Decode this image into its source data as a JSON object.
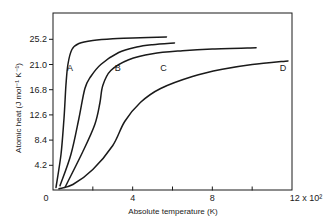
{
  "chart_data": {
    "type": "line",
    "title": "",
    "xlabel": "Absolute temperature (K)",
    "ylabel": "Atomic heat (J mol⁻¹ K⁻¹)",
    "x_multiplier_label": "12 x 10²",
    "x_unit_scale": 100,
    "xlim": [
      0,
      12
    ],
    "ylim": [
      0,
      29
    ],
    "x_ticks": [
      0,
      2,
      4,
      6,
      8,
      10,
      12
    ],
    "x_tick_labels": [
      "0",
      "",
      "4",
      "",
      "8",
      "",
      "12 x 10²"
    ],
    "y_ticks": [
      4.2,
      8.4,
      12.6,
      16.8,
      21.0,
      25.2
    ],
    "y_tick_labels": [
      "4.2",
      "8.4",
      "12.6",
      "16.8",
      "21.0",
      "25.2"
    ],
    "origin_label": "0",
    "grid": false,
    "legend": "inline labels",
    "series": [
      {
        "name": "A",
        "label_at": [
          0.85,
          20.4
        ],
        "x": [
          0.15,
          0.4,
          0.55,
          0.65,
          0.75,
          0.95,
          1.3,
          2.0,
          3.0,
          4.0,
          5.7
        ],
        "y": [
          0.5,
          6.0,
          12.0,
          17.5,
          21.0,
          23.5,
          24.5,
          25.0,
          25.3,
          25.4,
          25.6
        ]
      },
      {
        "name": "B",
        "label_at": [
          3.25,
          20.4
        ],
        "x": [
          0.35,
          0.9,
          1.3,
          1.6,
          1.9,
          2.4,
          3.3,
          4.2,
          5.0,
          6.1
        ],
        "y": [
          0.8,
          6.0,
          12.0,
          17.0,
          19.0,
          21.0,
          23.0,
          23.9,
          24.3,
          24.6
        ]
      },
      {
        "name": "C",
        "label_at": [
          5.55,
          20.4
        ],
        "x": [
          0.6,
          1.5,
          2.1,
          2.35,
          2.5,
          2.9,
          3.8,
          5.0,
          6.5,
          8.0,
          10.2
        ],
        "y": [
          0.5,
          6.5,
          11.0,
          14.5,
          17.5,
          20.0,
          21.8,
          22.8,
          23.3,
          23.6,
          23.8
        ]
      },
      {
        "name": "D",
        "label_at": [
          11.55,
          20.4
        ],
        "x": [
          0.3,
          1.0,
          2.0,
          3.0,
          3.6,
          4.4,
          5.4,
          7.0,
          8.5,
          10.0,
          11.8
        ],
        "y": [
          0.3,
          1.0,
          3.5,
          7.5,
          11.5,
          14.7,
          17.0,
          19.0,
          20.2,
          21.0,
          21.6
        ]
      }
    ]
  }
}
